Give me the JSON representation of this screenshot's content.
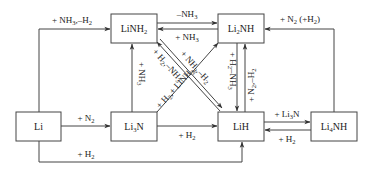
{
  "diagram": {
    "nodes": [
      {
        "id": "LiNH2",
        "base": "LiNH",
        "sub": "2",
        "tail": ""
      },
      {
        "id": "Li2NH",
        "base": "Li",
        "sub": "2",
        "tail": "NH"
      },
      {
        "id": "Li",
        "base": "Li",
        "sub": "",
        "tail": ""
      },
      {
        "id": "Li3N",
        "base": "Li",
        "sub": "3",
        "tail": "N"
      },
      {
        "id": "LiH",
        "base": "LiH",
        "sub": "",
        "tail": ""
      },
      {
        "id": "Li4NH",
        "base": "Li",
        "sub": "4",
        "tail": "NH"
      }
    ],
    "edges": [
      {
        "id": "li-to-linh2",
        "from": "Li",
        "to": "LiNH2",
        "label": "+ NH3,–H2"
      },
      {
        "id": "linh2-to-li2nh",
        "from": "LiNH2",
        "to": "Li2NH",
        "label": "–NH3"
      },
      {
        "id": "li2nh-to-linh2",
        "from": "Li2NH",
        "to": "LiNH2",
        "label": "+ NH3"
      },
      {
        "id": "li4nh-to-li2nh",
        "from": "Li4NH",
        "to": "Li2NH",
        "label": "+ N2 (+H2)"
      },
      {
        "id": "li-to-li3n",
        "from": "Li",
        "to": "Li3N",
        "label": "+ N2"
      },
      {
        "id": "li3n-to-linh2",
        "from": "Li3N",
        "to": "LiNH2",
        "label": "+ NH3"
      },
      {
        "id": "li3n-to-lih",
        "from": "Li3N",
        "to": "LiH",
        "label": "+ H2"
      },
      {
        "id": "li-to-lih",
        "from": "Li",
        "to": "LiH",
        "label": "+ H2"
      },
      {
        "id": "lih-to-linh2",
        "from": "LiH",
        "to": "LiNH2",
        "label": "+ H2,–NH3"
      },
      {
        "id": "linh2-to-lih",
        "from": "LiNH2",
        "to": "LiH",
        "label": "+ H2,+ LiNH2"
      },
      {
        "id": "lih-to-li2nh",
        "from": "LiH",
        "to": "Li2NH",
        "label": "+ NH3,–H2"
      },
      {
        "id": "li2nh-to-lih",
        "from": "Li2NH",
        "to": "LiH",
        "label": "+ H2,–NH3"
      },
      {
        "id": "lih-to-li2nh-n2",
        "from": "LiH",
        "to": "Li2NH",
        "label": "+ N2,–H2"
      },
      {
        "id": "lih-to-li4nh",
        "from": "LiH",
        "to": "Li4NH",
        "label": "+ Li3N"
      },
      {
        "id": "li4nh-to-lih",
        "from": "Li4NH",
        "to": "LiH",
        "label": "+ H2"
      }
    ]
  },
  "labels": {
    "li_linh2": {
      "a": "+ NH",
      "s1": "3",
      "b": ",–H",
      "s2": "2"
    },
    "minus_nh3": {
      "a": "–NH",
      "s1": "3"
    },
    "plus_nh3_top": {
      "a": "+ NH",
      "s1": "3"
    },
    "n2_h2": {
      "a": "+ N",
      "s1": "2",
      "b": " (+H",
      "s2": "2",
      "c": ")"
    },
    "plus_n2": {
      "a": "+ N",
      "s1": "2"
    },
    "plus_h2_li3n_lih": {
      "a": "+ H",
      "s1": "2"
    },
    "plus_h2_bottom": {
      "a": "+ H",
      "s1": "2"
    },
    "plus_li3n": {
      "a": "+ Li",
      "s1": "3",
      "b": "N"
    },
    "plus_h2_li4nh": {
      "a": "+ H",
      "s1": "2"
    },
    "vert_nh3": {
      "a": "+ NH",
      "s1": "3"
    },
    "vert_h2_nh3": {
      "a": "+ H",
      "s1": "2",
      "b": "–NH",
      "s2": "3"
    },
    "vert_n2_h2": {
      "a": "+ N",
      "s1": "2",
      "b": ",–H",
      "s2": "2"
    },
    "diag_h2_nh3": {
      "a": "+ H",
      "s1": "2",
      "b": ",–NH",
      "s2": "3"
    },
    "diag_nh3_h2": {
      "a": "+ NH",
      "s1": "3",
      "b": ",–H",
      "s2": "2"
    },
    "diag_h2_linh2": {
      "a": "+ H",
      "s1": "2",
      "b": ",+ LiNH",
      "s2": "2"
    }
  },
  "colors": {
    "stroke": "#444444",
    "text": "#222222",
    "background": "#ffffff"
  }
}
